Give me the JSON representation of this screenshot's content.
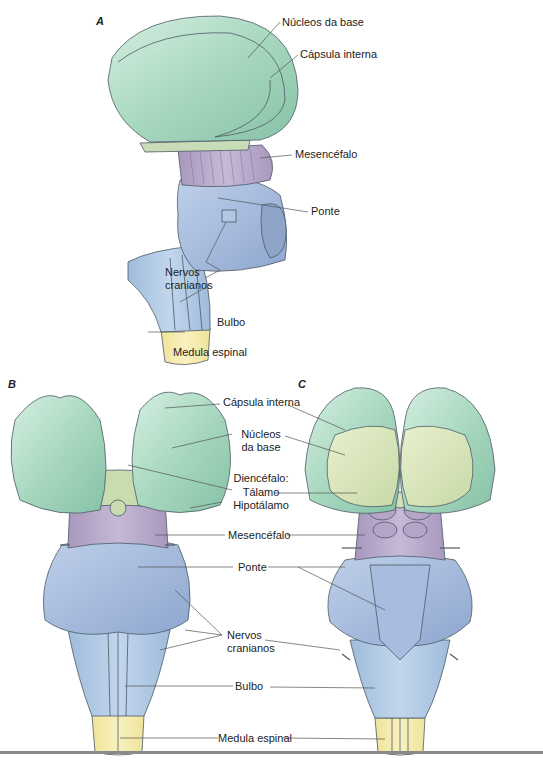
{
  "figure": {
    "panels": [
      {
        "id": "A",
        "view": "lateral",
        "labels": {
          "nucleos_base": "Núcleos da base",
          "capsula_interna": "Cápsula interna",
          "mesencefalo": "Mesencéfalo",
          "ponte": "Ponte",
          "nervos_line1": "Nervos",
          "nervos_line2": "cranianos",
          "bulbo": "Bulbo",
          "medula": "Medula espinal"
        }
      },
      {
        "id": "B",
        "view": "ventral",
        "labels": {
          "capsula_interna": "Cápsula interna",
          "nucleos_line1": "Núcleos",
          "nucleos_line2": "da base",
          "diencefalo": "Diencéfalo:",
          "talamo": "Tálamo",
          "hipotalamo": "Hipotálamo",
          "mesencefalo": "Mesencéfalo",
          "ponte": "Ponte",
          "nervos_line1": "Nervos",
          "nervos_line2": "cranianos",
          "bulbo": "Bulbo",
          "medula": "Medula espinal"
        }
      },
      {
        "id": "C",
        "view": "dorsal"
      }
    ],
    "colors": {
      "cerebrum_green": "#a9d8c0",
      "thalamus_yellowgreen": "#d6e3b8",
      "midbrain_purple": "#b7a9c9",
      "pons_blue": "#9fb6d8",
      "medulla_blue": "#b2cbe6",
      "spinal_yellow": "#f2eaa6",
      "outline": "#4c5a66"
    }
  }
}
